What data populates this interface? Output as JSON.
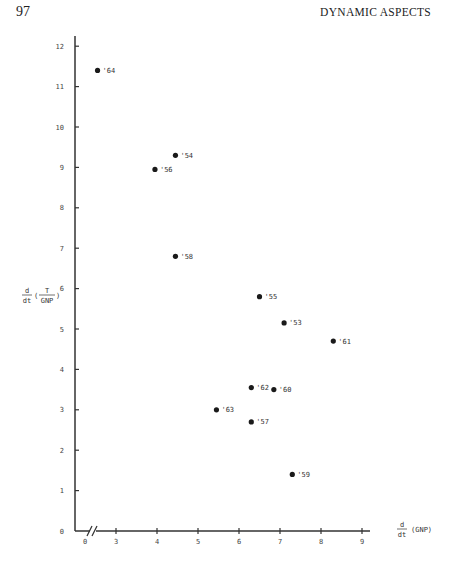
{
  "page": {
    "number": "97",
    "running_head": "DYNAMIC ASPECTS"
  },
  "chart_data": {
    "type": "scatter",
    "title": "",
    "xlabel": "d/dt (GNP)",
    "ylabel": "d/dt (T/GNP)",
    "xlabel_parts": {
      "num": "d",
      "den": "dt",
      "rest": "(GNP)"
    },
    "ylabel_parts": {
      "num": "d",
      "den": "dt",
      "inner_num": "T",
      "inner_den": "GNP"
    },
    "x_axis_break": true,
    "x_ticks": [
      "0",
      "3",
      "4",
      "5",
      "6",
      "7",
      "8",
      "9"
    ],
    "y_ticks": [
      "0",
      "1",
      "2",
      "3",
      "4",
      "5",
      "6",
      "7",
      "8",
      "9",
      "10",
      "11",
      "12"
    ],
    "xlim": [
      2.3,
      9.5
    ],
    "ylim": [
      0,
      12.5
    ],
    "grid": false,
    "legend": null,
    "points": [
      {
        "label": "'64",
        "x": 2.55,
        "y": 11.4
      },
      {
        "label": "'54",
        "x": 4.45,
        "y": 9.3
      },
      {
        "label": "'56",
        "x": 3.95,
        "y": 8.95
      },
      {
        "label": "'58",
        "x": 4.45,
        "y": 6.8
      },
      {
        "label": "'55",
        "x": 6.5,
        "y": 5.8
      },
      {
        "label": "'53",
        "x": 7.1,
        "y": 5.15
      },
      {
        "label": "'61",
        "x": 8.3,
        "y": 4.7
      },
      {
        "label": "'62",
        "x": 6.3,
        "y": 3.55
      },
      {
        "label": "'60",
        "x": 6.85,
        "y": 3.5
      },
      {
        "label": "'63",
        "x": 5.45,
        "y": 3.0
      },
      {
        "label": "'57",
        "x": 6.3,
        "y": 2.7
      },
      {
        "label": "'59",
        "x": 7.3,
        "y": 1.4
      }
    ]
  }
}
